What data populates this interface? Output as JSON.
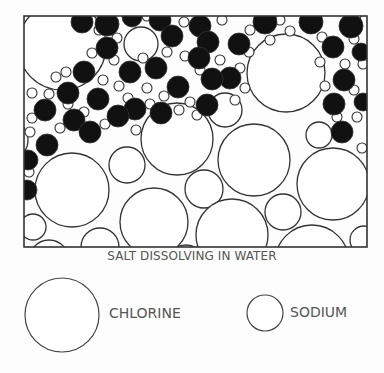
{
  "diagram": {
    "caption": "SALT DISSOLVING IN WATER",
    "frame": {
      "x": 24,
      "y": 16,
      "w": 343,
      "h": 231,
      "stroke": "#333333"
    },
    "colors": {
      "stroke": "#333333",
      "chloride_fill": "#111111",
      "background": "#fdfdfd"
    },
    "water_molecules_large": [
      [
        62,
        46,
        44
      ],
      [
        141,
        44,
        17
      ],
      [
        286,
        73,
        39
      ],
      [
        72,
        190,
        37
      ],
      [
        177,
        139,
        36
      ],
      [
        254,
        160,
        36
      ],
      [
        319,
        135,
        13
      ],
      [
        127,
        165,
        18
      ],
      [
        204,
        189,
        19
      ],
      [
        333,
        184,
        36
      ],
      [
        154,
        222,
        34
      ],
      [
        232,
        235,
        36
      ],
      [
        283,
        212,
        18
      ],
      [
        312,
        262,
        37
      ],
      [
        364,
        240,
        14
      ],
      [
        33,
        227,
        13
      ],
      [
        100,
        247,
        19
      ],
      [
        49,
        260,
        20
      ],
      [
        225,
        110,
        17
      ],
      [
        8,
        140,
        20
      ],
      [
        186,
        265,
        20
      ]
    ],
    "chlorine_ions": [
      [
        82,
        22,
        11
      ],
      [
        107,
        24,
        12
      ],
      [
        132,
        17,
        10
      ],
      [
        160,
        20,
        11
      ],
      [
        200,
        26,
        11
      ],
      [
        265,
        22,
        12
      ],
      [
        311,
        22,
        12
      ],
      [
        351,
        26,
        12
      ],
      [
        107,
        48,
        11
      ],
      [
        172,
        36,
        11
      ],
      [
        208,
        42,
        11
      ],
      [
        239,
        44,
        11
      ],
      [
        333,
        47,
        11
      ],
      [
        361,
        52,
        9
      ],
      [
        84,
        72,
        11
      ],
      [
        130,
        72,
        11
      ],
      [
        156,
        68,
        11
      ],
      [
        199,
        58,
        11
      ],
      [
        230,
        78,
        11
      ],
      [
        344,
        80,
        11
      ],
      [
        68,
        93,
        11
      ],
      [
        98,
        99,
        11
      ],
      [
        135,
        109,
        11
      ],
      [
        178,
        87,
        11
      ],
      [
        212,
        79,
        11
      ],
      [
        334,
        104,
        11
      ],
      [
        45,
        110,
        11
      ],
      [
        74,
        120,
        11
      ],
      [
        118,
        116,
        11
      ],
      [
        161,
        113,
        11
      ],
      [
        207,
        105,
        11
      ],
      [
        342,
        132,
        11
      ],
      [
        47,
        145,
        11
      ],
      [
        90,
        132,
        11
      ],
      [
        28,
        160,
        10
      ],
      [
        27,
        190,
        10
      ],
      [
        363,
        102,
        9
      ]
    ],
    "sodium_ions": [
      [
        99,
        30,
        5
      ],
      [
        117,
        38,
        5
      ],
      [
        147,
        16,
        5
      ],
      [
        184,
        22,
        5
      ],
      [
        222,
        20,
        5
      ],
      [
        250,
        30,
        5
      ],
      [
        280,
        20,
        5
      ],
      [
        290,
        31,
        5
      ],
      [
        322,
        37,
        5
      ],
      [
        356,
        16,
        5
      ],
      [
        92,
        53,
        5
      ],
      [
        114,
        60,
        5
      ],
      [
        143,
        58,
        5
      ],
      [
        167,
        52,
        5
      ],
      [
        185,
        56,
        5
      ],
      [
        220,
        60,
        5
      ],
      [
        249,
        52,
        5
      ],
      [
        320,
        62,
        5
      ],
      [
        354,
        39,
        5
      ],
      [
        363,
        64,
        5
      ],
      [
        56,
        77,
        5
      ],
      [
        66,
        72,
        5
      ],
      [
        103,
        80,
        5
      ],
      [
        119,
        86,
        5
      ],
      [
        147,
        88,
        5
      ],
      [
        164,
        96,
        5
      ],
      [
        190,
        102,
        5
      ],
      [
        200,
        70,
        5
      ],
      [
        245,
        88,
        5
      ],
      [
        325,
        86,
        5
      ],
      [
        32,
        93,
        5
      ],
      [
        49,
        94,
        5
      ],
      [
        84,
        112,
        5
      ],
      [
        150,
        104,
        5
      ],
      [
        179,
        110,
        5
      ],
      [
        197,
        115,
        5
      ],
      [
        235,
        100,
        5
      ],
      [
        354,
        90,
        5
      ],
      [
        337,
        117,
        5
      ],
      [
        357,
        117,
        5
      ],
      [
        32,
        118,
        5
      ],
      [
        60,
        128,
        5
      ],
      [
        105,
        124,
        5
      ],
      [
        136,
        130,
        5
      ],
      [
        30,
        132,
        5
      ],
      [
        128,
        98,
        5
      ],
      [
        68,
        104,
        5
      ],
      [
        345,
        64,
        5
      ],
      [
        270,
        40,
        5
      ],
      [
        240,
        68,
        5
      ],
      [
        29,
        172,
        5
      ],
      [
        362,
        148,
        5
      ]
    ]
  },
  "legend": {
    "chlorine": {
      "label": "CHLORINE",
      "cx": 62,
      "cy": 315,
      "r": 37
    },
    "sodium": {
      "label": "SODIUM",
      "cx": 265,
      "cy": 313,
      "r": 18
    }
  }
}
